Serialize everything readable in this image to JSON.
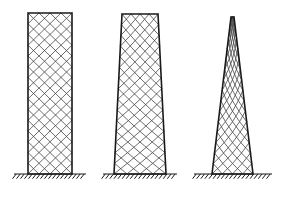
{
  "figure": {
    "name": "lattice-tower-comparison",
    "background_color": "#ffffff",
    "stroke_color": "#1a1a1a",
    "lattice_color": "#3c3c3c",
    "canvas": {
      "width": 285,
      "height": 198
    },
    "towers": [
      {
        "id": "tower-1",
        "label": "prismatic-lattice-tower",
        "shape": "rectangular",
        "top_left_x": 28,
        "top_right_x": 72,
        "base_left_x": 28,
        "base_right_x": 72,
        "top_y": 13,
        "base_y": 174,
        "top_width": 44,
        "base_width": 44,
        "height": 161,
        "taper_ratio": 1.0,
        "lattice_cells_across": 4,
        "lattice_cells_high": 15,
        "ground": {
          "id": "ground-1",
          "line_x1": 14,
          "line_x2": 86,
          "line_y": 174,
          "hatch_count": 18,
          "hatch_length": 6,
          "hatch_angle_deg": 52
        }
      },
      {
        "id": "tower-2",
        "label": "slightly-tapered-lattice-tower",
        "shape": "tapered",
        "top_left_x": 122,
        "top_right_x": 158,
        "base_left_x": 114,
        "base_right_x": 166,
        "top_y": 14,
        "base_y": 174,
        "top_width": 36,
        "base_width": 52,
        "height": 160,
        "taper_ratio": 0.69,
        "lattice_cells_across": 4,
        "lattice_cells_high": 15,
        "ground": {
          "id": "ground-2",
          "line_x1": 103,
          "line_x2": 177,
          "line_y": 174,
          "hatch_count": 18,
          "hatch_length": 6,
          "hatch_angle_deg": 52
        }
      },
      {
        "id": "tower-3",
        "label": "sharply-tapered-triangular-lattice-tower",
        "shape": "triangular",
        "top_left_x": 231,
        "top_right_x": 234,
        "base_left_x": 212,
        "base_right_x": 253,
        "top_y": 17,
        "base_y": 174,
        "top_width": 3,
        "base_width": 41,
        "height": 157,
        "taper_ratio": 0.07,
        "lattice_cells_across": 4,
        "lattice_cells_high": 15,
        "ground": {
          "id": "ground-3",
          "line_x1": 194,
          "line_x2": 272,
          "line_y": 174,
          "hatch_count": 19,
          "hatch_length": 6,
          "hatch_angle_deg": 52
        }
      }
    ]
  }
}
